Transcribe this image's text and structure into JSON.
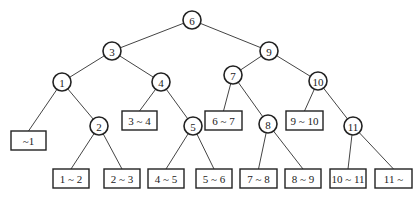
{
  "diagram": {
    "type": "binary-search-tree",
    "internal_nodes": [
      {
        "id": "n6",
        "label": "6",
        "x": 192,
        "y": 20
      },
      {
        "id": "n3",
        "label": "3",
        "x": 112,
        "y": 51
      },
      {
        "id": "n9",
        "label": "9",
        "x": 269,
        "y": 51
      },
      {
        "id": "n1",
        "label": "1",
        "x": 62,
        "y": 82
      },
      {
        "id": "n4",
        "label": "4",
        "x": 161,
        "y": 82
      },
      {
        "id": "n7",
        "label": "7",
        "x": 233,
        "y": 75
      },
      {
        "id": "n10",
        "label": "10",
        "x": 318,
        "y": 81
      },
      {
        "id": "n2",
        "label": "2",
        "x": 99,
        "y": 126
      },
      {
        "id": "n5",
        "label": "5",
        "x": 193,
        "y": 126
      },
      {
        "id": "n8",
        "label": "8",
        "x": 268,
        "y": 124
      },
      {
        "id": "n11",
        "label": "11",
        "x": 353,
        "y": 126
      }
    ],
    "leaves": [
      {
        "id": "l0",
        "label": "~1",
        "x": 11,
        "y": 131,
        "w": 35,
        "h": 19
      },
      {
        "id": "l1",
        "label": "1 ~ 2",
        "x": 53,
        "y": 169,
        "w": 36,
        "h": 19
      },
      {
        "id": "l2",
        "label": "2 ~ 3",
        "x": 104,
        "y": 169,
        "w": 36,
        "h": 19
      },
      {
        "id": "l3",
        "label": "3 ~ 4",
        "x": 122,
        "y": 111,
        "w": 35,
        "h": 19
      },
      {
        "id": "l4",
        "label": "4 ~ 5",
        "x": 148,
        "y": 169,
        "w": 36,
        "h": 19
      },
      {
        "id": "l5",
        "label": "5 ~ 6",
        "x": 196,
        "y": 169,
        "w": 36,
        "h": 19
      },
      {
        "id": "l6",
        "label": "6 ~ 7",
        "x": 205,
        "y": 111,
        "w": 37,
        "h": 19
      },
      {
        "id": "l7",
        "label": "7 ~ 8",
        "x": 240,
        "y": 169,
        "w": 37,
        "h": 19
      },
      {
        "id": "l8",
        "label": "8 ~ 9",
        "x": 285,
        "y": 169,
        "w": 36,
        "h": 19
      },
      {
        "id": "l9",
        "label": "9 ~ 10",
        "x": 286,
        "y": 111,
        "w": 37,
        "h": 19
      },
      {
        "id": "l10",
        "label": "10 ~ 11",
        "x": 330,
        "y": 169,
        "w": 36,
        "h": 19
      },
      {
        "id": "l11",
        "label": "11 ~",
        "x": 375,
        "y": 169,
        "w": 37,
        "h": 19
      }
    ],
    "edges": [
      [
        "n6",
        "n3"
      ],
      [
        "n6",
        "n9"
      ],
      [
        "n3",
        "n1"
      ],
      [
        "n3",
        "n4"
      ],
      [
        "n9",
        "n7"
      ],
      [
        "n9",
        "n10"
      ],
      [
        "n1",
        "l0"
      ],
      [
        "n1",
        "n2"
      ],
      [
        "n4",
        "l3"
      ],
      [
        "n4",
        "n5"
      ],
      [
        "n7",
        "l6"
      ],
      [
        "n7",
        "n8"
      ],
      [
        "n10",
        "l9"
      ],
      [
        "n10",
        "n11"
      ],
      [
        "n2",
        "l1"
      ],
      [
        "n2",
        "l2"
      ],
      [
        "n5",
        "l4"
      ],
      [
        "n5",
        "l5"
      ],
      [
        "n8",
        "l7"
      ],
      [
        "n8",
        "l8"
      ],
      [
        "n11",
        "l10"
      ],
      [
        "n11",
        "l11"
      ]
    ],
    "node_radius": 9
  }
}
